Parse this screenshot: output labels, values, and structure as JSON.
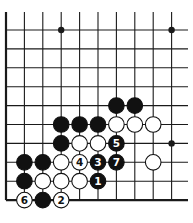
{
  "diagram": {
    "type": "go-board-corner",
    "grid": {
      "columns": 10,
      "rows": 10,
      "x0": 6,
      "dx": 18.4,
      "y0": 30,
      "dy": 18.9,
      "line_extend_right": 188,
      "line_extend_top": 12,
      "line_color": "#1a1a1a",
      "edges": [
        "left",
        "bottom"
      ]
    },
    "star_points": [
      {
        "col": 3,
        "row": 0
      },
      {
        "col": 9,
        "row": 0
      },
      {
        "col": 9,
        "row": 6
      }
    ],
    "stones": [
      {
        "col": 6,
        "row": 4,
        "color": "black",
        "label": ""
      },
      {
        "col": 7,
        "row": 4,
        "color": "black",
        "label": ""
      },
      {
        "col": 3,
        "row": 5,
        "color": "black",
        "label": ""
      },
      {
        "col": 4,
        "row": 5,
        "color": "black",
        "label": ""
      },
      {
        "col": 5,
        "row": 5,
        "color": "black",
        "label": ""
      },
      {
        "col": 6,
        "row": 5,
        "color": "white",
        "label": ""
      },
      {
        "col": 7,
        "row": 5,
        "color": "white",
        "label": ""
      },
      {
        "col": 8,
        "row": 5,
        "color": "white",
        "label": ""
      },
      {
        "col": 3,
        "row": 6,
        "color": "black",
        "label": ""
      },
      {
        "col": 4,
        "row": 6,
        "color": "white",
        "label": ""
      },
      {
        "col": 5,
        "row": 6,
        "color": "white",
        "label": ""
      },
      {
        "col": 6,
        "row": 6,
        "color": "black",
        "label": "5"
      },
      {
        "col": 1,
        "row": 7,
        "color": "black",
        "label": ""
      },
      {
        "col": 2,
        "row": 7,
        "color": "black",
        "label": ""
      },
      {
        "col": 3,
        "row": 7,
        "color": "white",
        "label": ""
      },
      {
        "col": 4,
        "row": 7,
        "color": "white",
        "label": "4"
      },
      {
        "col": 5,
        "row": 7,
        "color": "black",
        "label": "3"
      },
      {
        "col": 6,
        "row": 7,
        "color": "black",
        "label": "7"
      },
      {
        "col": 8,
        "row": 7,
        "color": "white",
        "label": ""
      },
      {
        "col": 1,
        "row": 8,
        "color": "black",
        "label": ""
      },
      {
        "col": 2,
        "row": 8,
        "color": "white",
        "label": ""
      },
      {
        "col": 3,
        "row": 8,
        "color": "white",
        "label": ""
      },
      {
        "col": 4,
        "row": 8,
        "color": "white",
        "label": ""
      },
      {
        "col": 5,
        "row": 8,
        "color": "black",
        "label": "1"
      },
      {
        "col": 1,
        "row": 9,
        "color": "white",
        "label": "6"
      },
      {
        "col": 2,
        "row": 9,
        "color": "black",
        "label": ""
      },
      {
        "col": 3,
        "row": 9,
        "color": "white",
        "label": "2"
      }
    ],
    "colors": {
      "black_stone": "#111111",
      "white_stone": "#ffffff",
      "stone_outline": "#111111",
      "label_on_black": "#ffffff",
      "label_on_white": "#111111"
    }
  }
}
